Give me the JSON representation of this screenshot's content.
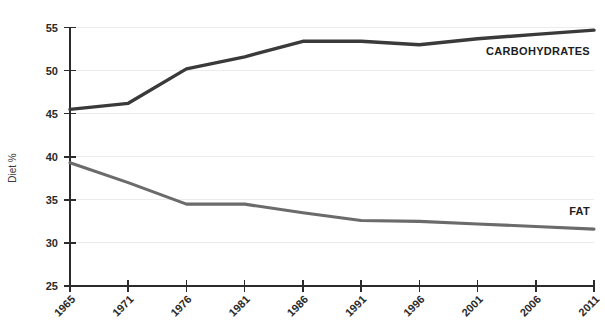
{
  "chart_data": {
    "type": "line",
    "title": "",
    "subtitle": "",
    "xlabel": "",
    "ylabel": "Diet %",
    "x": [
      1965,
      1971,
      1976,
      1981,
      1986,
      1991,
      1996,
      2001,
      2006,
      2011
    ],
    "categories": [
      "1965",
      "1971",
      "1976",
      "1981",
      "1986",
      "1991",
      "1996",
      "2001",
      "2006",
      "2011"
    ],
    "series": [
      {
        "name": "CARBOHYDRATES",
        "color": "#3a3a3a",
        "values": [
          45.5,
          46.2,
          50.2,
          51.6,
          53.4,
          53.4,
          53.0,
          53.7,
          54.2,
          54.7
        ]
      },
      {
        "name": "FAT",
        "color": "#6b6b6b",
        "values": [
          39.3,
          37.0,
          34.5,
          34.5,
          33.5,
          32.6,
          32.5,
          32.2,
          31.9,
          31.6
        ]
      }
    ],
    "ylim": [
      25,
      55
    ],
    "yticks": [
      25,
      30,
      35,
      40,
      45,
      50,
      55
    ],
    "ytick_labels": [
      "25",
      "30",
      "35",
      "40",
      "45",
      "50",
      "55"
    ],
    "grid": true,
    "grid_axis": "y",
    "legend": "inline-end-of-line",
    "legend_position": "right",
    "annotations": [
      {
        "text": "CARBOHYDRATES",
        "series": "CARBOHYDRATES"
      },
      {
        "text": "FAT",
        "series": "FAT"
      }
    ]
  },
  "axis": {
    "y_title": "Diet %"
  }
}
